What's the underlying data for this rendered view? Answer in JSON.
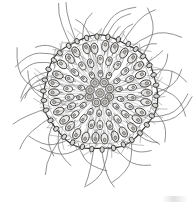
{
  "figure": {
    "medium": "ink line engraving",
    "background_color": "#ffffff",
    "ink_color": "#333333",
    "cell_fill_color": "#f2f1ef",
    "flagella_color": "#6e6e6e",
    "caption_text": "",
    "canvas": {
      "width": 194,
      "height": 206
    }
  },
  "colony": {
    "center_x": 100,
    "center_y": 93,
    "body_radius": 56,
    "membrane_radius": 57,
    "inner_membrane_radius": 52,
    "rim_node_count": 34,
    "somatic_cell_rings": [
      {
        "name": "outer-ring",
        "radius": 46,
        "count": 30,
        "cell_length": 11,
        "cell_width": 7
      },
      {
        "name": "mid-ring",
        "radius": 32,
        "count": 22,
        "cell_length": 9,
        "cell_width": 6
      },
      {
        "name": "inner-ring",
        "radius": 20,
        "count": 14,
        "cell_length": 7,
        "cell_width": 5
      }
    ],
    "flagella": {
      "outer_count": 44,
      "outer_min_length": 20,
      "outer_max_length": 46,
      "inner_count": 60
    },
    "daughter_colonies": {
      "count": 9,
      "cluster_radius": 11,
      "cell_radius": 4.2
    }
  },
  "labels": {
    "figure_label": "",
    "scale_text": ""
  }
}
